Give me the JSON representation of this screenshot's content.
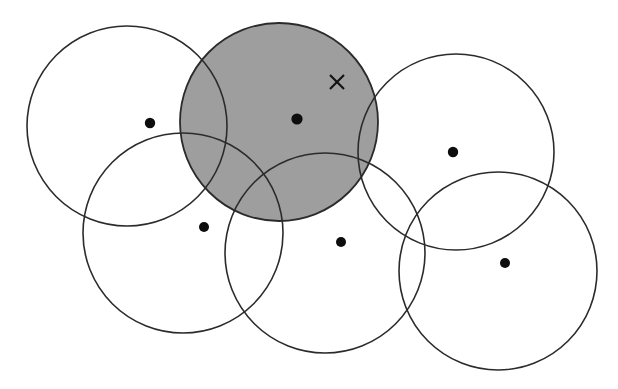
{
  "figure": {
    "title": "",
    "caption": "",
    "background_color": "#ffffff",
    "outline_color": "#2b2b2b",
    "shade_color": "#9e9e9e",
    "dot_color": "#0d0d0d",
    "marker_color": "#131313"
  },
  "chart_data": {
    "type": "scatter",
    "title": "",
    "xlabel": "",
    "ylabel": "",
    "grid": false,
    "legend": null,
    "xlim": [
      0,
      618
    ],
    "ylim": [
      0,
      389
    ],
    "circles": [
      {
        "id": "circle-top-left",
        "cx": 127,
        "cy": 126,
        "r": 100,
        "shaded": false,
        "label": ""
      },
      {
        "id": "circle-shaded-top-center",
        "cx": 279,
        "cy": 122,
        "r": 99,
        "shaded": true,
        "label": ""
      },
      {
        "id": "circle-top-right",
        "cx": 456,
        "cy": 152,
        "r": 98,
        "shaded": false,
        "label": ""
      },
      {
        "id": "circle-bottom-left",
        "cx": 183,
        "cy": 233,
        "r": 100,
        "shaded": false,
        "label": ""
      },
      {
        "id": "circle-bottom-center",
        "cx": 325,
        "cy": 253,
        "r": 100,
        "shaded": false,
        "label": ""
      },
      {
        "id": "circle-bottom-right",
        "cx": 498,
        "cy": 271,
        "r": 99,
        "shaded": false,
        "label": ""
      }
    ],
    "points": [
      {
        "id": "point-1",
        "x": 150,
        "y": 123,
        "r": 5.2,
        "label": ""
      },
      {
        "id": "point-2",
        "x": 297,
        "y": 119,
        "r": 5.6,
        "label": ""
      },
      {
        "id": "point-3",
        "x": 453,
        "y": 152,
        "r": 5.2,
        "label": ""
      },
      {
        "id": "point-4",
        "x": 204,
        "y": 227,
        "r": 5.0,
        "label": ""
      },
      {
        "id": "point-5",
        "x": 341,
        "y": 242,
        "r": 5.0,
        "label": ""
      },
      {
        "id": "point-6",
        "x": 505,
        "y": 263,
        "r": 5.0,
        "label": ""
      }
    ],
    "markers": [
      {
        "id": "marker-x",
        "x": 337,
        "y": 82,
        "size": 7,
        "glyph": "x-marker",
        "label": ""
      }
    ]
  }
}
